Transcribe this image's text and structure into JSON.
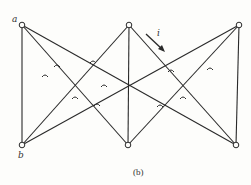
{
  "labels": {
    "a": "a",
    "b": "b",
    "current": "i"
  },
  "caption": "(b)",
  "colors": {
    "line": "#2a2a2a",
    "background": "#fdfdfb"
  },
  "nodes": [
    "a",
    "top-middle",
    "top-right",
    "b",
    "bottom-middle",
    "bottom-right"
  ],
  "edges": [
    [
      "a",
      "b"
    ],
    [
      "a",
      "bottom-middle"
    ],
    [
      "a",
      "bottom-right"
    ],
    [
      "b",
      "top-middle"
    ],
    [
      "b",
      "top-right"
    ],
    [
      "top-middle",
      "bottom-middle"
    ],
    [
      "top-middle",
      "bottom-right"
    ],
    [
      "bottom-middle",
      "top-right"
    ],
    [
      "top-right",
      "bottom-right"
    ]
  ]
}
